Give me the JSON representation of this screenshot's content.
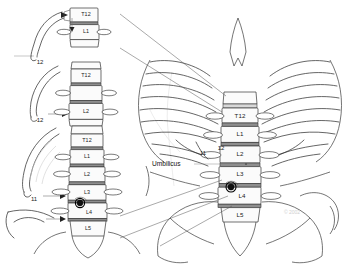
{
  "figure": {
    "background_color": "#ffffff",
    "line_color": "#2b2b2b",
    "disc_color": "#8e8e8e",
    "marker_color": "#111111",
    "watermark": "© 2002"
  },
  "annotations": {
    "umbilicus_label": "Umbilicus"
  },
  "panels": [
    {
      "id": "panel-1",
      "name": "twelfth-rib-at-T12-L1",
      "rib_label": "12",
      "vertebrae": [
        {
          "label": "T12",
          "level": "T12"
        },
        {
          "label": "L1",
          "level": "L1"
        }
      ]
    },
    {
      "id": "panel-2",
      "name": "twelfth-rib-at-L2",
      "rib_label": "12",
      "vertebrae": [
        {
          "label": "T12",
          "level": "T12"
        },
        {
          "label": "",
          "level": "L1"
        },
        {
          "label": "L2",
          "level": "L2"
        }
      ]
    },
    {
      "id": "panel-3",
      "name": "eleventh-rib-and-iliac-crest-to-L4",
      "rib_label": "11",
      "vertebrae": [
        {
          "label": "T12",
          "level": "T12"
        },
        {
          "label": "L1",
          "level": "L1"
        },
        {
          "label": "L2",
          "level": "L2"
        },
        {
          "label": "L3",
          "level": "L3"
        },
        {
          "label": "L4",
          "level": "L4"
        },
        {
          "label": "L5",
          "level": "L5"
        }
      ]
    }
  ],
  "torso": {
    "name": "anterior-torso-skeleton",
    "rib_labels": [
      "11",
      "12"
    ],
    "spine": {
      "name": "lumbar-spine-column",
      "vertebrae": [
        {
          "label": "T12",
          "level": "T12"
        },
        {
          "label": "L1",
          "level": "L1"
        },
        {
          "label": "L2",
          "level": "L2"
        },
        {
          "label": "L3",
          "level": "L3"
        },
        {
          "label": "L4",
          "level": "L4"
        },
        {
          "label": "L5",
          "level": "L5"
        }
      ]
    },
    "needle_marker": {
      "name": "needle-entry-marker",
      "level": "L3-L4"
    }
  }
}
